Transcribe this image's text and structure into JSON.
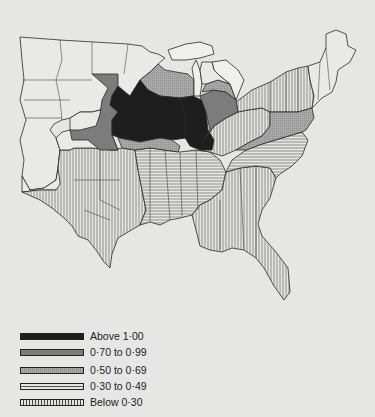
{
  "map": {
    "subject": "United States (central and eastern) by sub-state region, shaded by value class",
    "colors": {
      "background": "#e6e6e4",
      "outline": "#2a2a2a",
      "above_1_00": "#1e1e1e",
      "0_70_to_0_99": "#7c7c7c",
      "0_50_to_0_69": "#a8a8a8",
      "0_30_to_0_49": "#d0d0d0",
      "below_0_30": "#d8d8d8",
      "unshaded": "#e9e9e7"
    }
  },
  "legend": {
    "items": [
      {
        "label": "Above 1·00",
        "pattern": "solid-black"
      },
      {
        "label": "0·70 to 0·99",
        "pattern": "dark-grey"
      },
      {
        "label": "0·50 to 0·69",
        "pattern": "light-grey-stipple"
      },
      {
        "label": "0·30 to 0·49",
        "pattern": "horizontal-hatch"
      },
      {
        "label": "Below 0·30",
        "pattern": "vertical-hatch"
      }
    ]
  }
}
